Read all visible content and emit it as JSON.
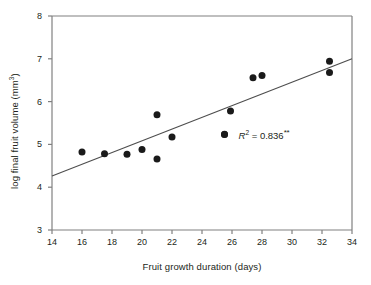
{
  "chart_data": {
    "type": "scatter",
    "title": "",
    "xlabel": "Fruit growth duration (days)",
    "ylabel": "log final fruit volume (mm3)",
    "ylabel_base": "log final fruit volume (mm",
    "ylabel_sup": "3",
    "ylabel_tail": ")",
    "xlim": [
      14,
      34
    ],
    "ylim": [
      3,
      8
    ],
    "xticks": [
      14,
      16,
      18,
      20,
      22,
      24,
      26,
      28,
      30,
      32,
      34
    ],
    "yticks": [
      3,
      4,
      5,
      6,
      7,
      8
    ],
    "xtick_labels": [
      "14",
      "16",
      "18",
      "20",
      "22",
      "24",
      "26",
      "28",
      "30",
      "32",
      "34"
    ],
    "ytick_labels": [
      "3",
      "4",
      "5",
      "6",
      "7",
      "8"
    ],
    "grid": false,
    "legend": false,
    "marker": "filled-circle",
    "marker_color": "#1a1a1a",
    "marker_size": 7,
    "axis_color": "#808080",
    "line_color": "#4d4d4d",
    "points": [
      {
        "x": 16.0,
        "y": 4.82
      },
      {
        "x": 17.5,
        "y": 4.78
      },
      {
        "x": 19.0,
        "y": 4.77
      },
      {
        "x": 20.0,
        "y": 4.88
      },
      {
        "x": 21.0,
        "y": 5.69
      },
      {
        "x": 21.0,
        "y": 4.66
      },
      {
        "x": 22.0,
        "y": 5.17
      },
      {
        "x": 25.5,
        "y": 5.24
      },
      {
        "x": 25.9,
        "y": 5.78
      },
      {
        "x": 27.4,
        "y": 6.56
      },
      {
        "x": 28.0,
        "y": 6.61
      },
      {
        "x": 32.5,
        "y": 6.94
      },
      {
        "x": 32.5,
        "y": 6.68
      }
    ],
    "trendline": {
      "x0": 14.0,
      "y0": 4.26,
      "x1": 34.0,
      "y1": 7.0
    },
    "annotations": [
      {
        "text": "R2 = 0.836**",
        "r_symbol": "R",
        "exponent": "2",
        "equals": " = ",
        "value": "0.836",
        "significance": "**",
        "x": 25.5,
        "y": 5.24
      }
    ]
  }
}
